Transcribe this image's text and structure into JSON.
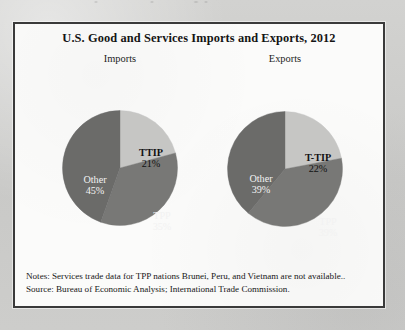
{
  "figure": {
    "title": "U.S. Good and Services Imports and Exports, 2012",
    "notes_line1": "Notes: Services trade data for TPP nations Brunei, Peru, and Vietnam are not available..",
    "notes_line2": "Source: Bureau of Economic Analysis; International Trade Commission."
  },
  "colors": {
    "slice_light": "#c6c6c4",
    "slice_mid": "#787876",
    "slice_dark": "#6b6b69",
    "panel_border": "#3a3a3a",
    "panel_bg": "#fbfbfa",
    "page_bg": "#cfcfcd"
  },
  "charts": {
    "imports": {
      "subtitle": "Imports",
      "labels": {
        "ttip_name": "TTIP",
        "ttip_pct": "21%",
        "other_name": "Other",
        "other_pct": "45%",
        "tpp_name": "TPP",
        "tpp_pct": "35%"
      }
    },
    "exports": {
      "subtitle": "Exports",
      "labels": {
        "ttip_name": "T-TIP",
        "ttip_pct": "22%",
        "other_name": "Other",
        "other_pct": "39%",
        "tpp_name": "TPP",
        "tpp_pct": "39%"
      }
    }
  },
  "chart_data": [
    {
      "type": "pie",
      "title": "Imports",
      "categories": [
        "TTIP",
        "TPP",
        "Other"
      ],
      "values": [
        21,
        35,
        45
      ],
      "value_labels": [
        "21%",
        "35%",
        "45%"
      ],
      "units": "percent",
      "start_angle_deg": 0,
      "direction": "clockwise",
      "colors": [
        "#c6c6c4",
        "#787876",
        "#6b6b69"
      ],
      "legend": "none",
      "data_labels": "inside slices"
    },
    {
      "type": "pie",
      "title": "Exports",
      "categories": [
        "T-TIP",
        "TPP",
        "Other"
      ],
      "values": [
        22,
        39,
        39
      ],
      "value_labels": [
        "22%",
        "39%",
        "39%"
      ],
      "units": "percent",
      "start_angle_deg": 0,
      "direction": "clockwise",
      "colors": [
        "#c6c6c4",
        "#787876",
        "#6b6b69"
      ],
      "legend": "none",
      "data_labels": "inside slices"
    }
  ]
}
